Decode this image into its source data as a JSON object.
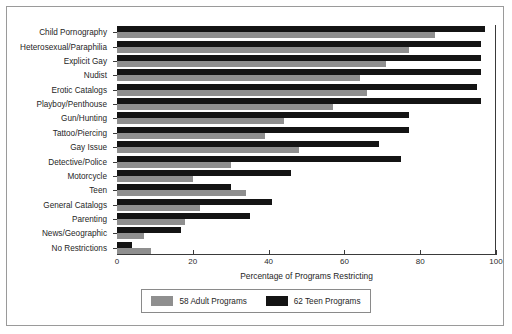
{
  "chart_data": {
    "type": "bar",
    "orientation": "horizontal",
    "title": "",
    "xlabel": "Percentage of Programs Restricting",
    "ylabel": "",
    "xlim": [
      0,
      100
    ],
    "xticks": [
      0,
      20,
      40,
      60,
      80,
      100
    ],
    "grid": false,
    "legend_position": "bottom-center",
    "categories": [
      "Child Pornography",
      "Heterosexual/Paraphilia",
      "Explicit Gay",
      "Nudist",
      "Erotic Catalogs",
      "Playboy/Penthouse",
      "Gun/Hunting",
      "Tattoo/Piercing",
      "Gay Issue",
      "Detective/Police",
      "Motorcycle",
      "Teen",
      "General Catalogs",
      "Parenting",
      "News/Geographic",
      "No Restrictions"
    ],
    "series": [
      {
        "name": "62 Teen Programs",
        "color": "#141414",
        "values": [
          97,
          96,
          96,
          96,
          95,
          96,
          77,
          77,
          69,
          75,
          46,
          30,
          41,
          35,
          17,
          4
        ]
      },
      {
        "name": "58 Adult Programs",
        "color": "#8f8f8f",
        "values": [
          84,
          77,
          71,
          64,
          66,
          57,
          44,
          39,
          48,
          30,
          20,
          34,
          22,
          18,
          7,
          9
        ]
      }
    ]
  },
  "legend": {
    "items": [
      {
        "label": "58 Adult Programs",
        "swatch": "adult-swatch"
      },
      {
        "label": "62 Teen Programs",
        "swatch": "teen-swatch"
      }
    ]
  }
}
